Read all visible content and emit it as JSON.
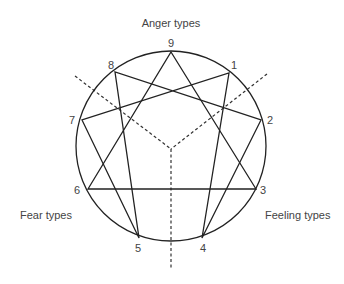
{
  "diagram": {
    "line_color": "#222222",
    "text_color": "#444444",
    "circle": {
      "cx": 171,
      "cy": 146,
      "r": 95
    },
    "center": {
      "x": 171,
      "y": 149
    },
    "groups": {
      "anger": "Anger types",
      "fear": "Fear types",
      "feeling": "Feeling types"
    },
    "points": [
      {
        "n": "1",
        "x": 229,
        "y": 73
      },
      {
        "n": "2",
        "x": 261,
        "y": 120
      },
      {
        "n": "3",
        "x": 256,
        "y": 189
      },
      {
        "n": "4",
        "x": 202,
        "y": 238
      },
      {
        "n": "5",
        "x": 139,
        "y": 238
      },
      {
        "n": "6",
        "x": 88,
        "y": 189
      },
      {
        "n": "7",
        "x": 82,
        "y": 120
      },
      {
        "n": "8",
        "x": 115,
        "y": 72
      },
      {
        "n": "9",
        "x": 171,
        "y": 52
      }
    ],
    "triangle": [
      "9",
      "3",
      "6"
    ],
    "hexad": [
      "1",
      "4",
      "2",
      "8",
      "5",
      "7"
    ],
    "dividers": [
      {
        "x1": 75,
        "y1": 76,
        "x2": 171,
        "y2": 149
      },
      {
        "x1": 267,
        "y1": 74,
        "x2": 171,
        "y2": 149
      },
      {
        "x1": 171,
        "y1": 149,
        "x2": 171,
        "y2": 268
      }
    ]
  }
}
